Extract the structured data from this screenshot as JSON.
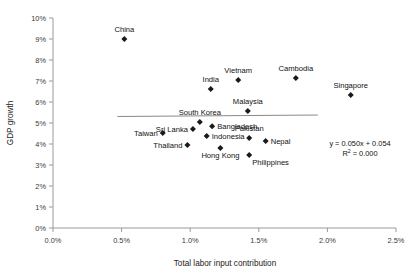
{
  "chart_data": {
    "type": "scatter",
    "title": "",
    "xlabel": "Total labor input contribution",
    "ylabel": "GDP growth",
    "xlim": [
      0.0,
      2.5
    ],
    "ylim": [
      0.0,
      10.0
    ],
    "x_tick_labels": [
      "0.0%",
      "0.5%",
      "1.0%",
      "1.5%",
      "2.0%",
      "2.5%"
    ],
    "x_ticks": [
      0.0,
      0.5,
      1.0,
      1.5,
      2.0,
      2.5
    ],
    "y_tick_labels": [
      "0%",
      "1%",
      "2%",
      "3%",
      "4%",
      "5%",
      "6%",
      "7%",
      "8%",
      "9%",
      "10%"
    ],
    "y_ticks": [
      0,
      1,
      2,
      3,
      4,
      5,
      6,
      7,
      8,
      9,
      10
    ],
    "grid": false,
    "legend": "none",
    "units": "percent",
    "points": [
      {
        "label": "China",
        "x": 0.52,
        "y": 9.0,
        "label_pos": "above"
      },
      {
        "label": "Taiwan",
        "x": 0.8,
        "y": 4.52,
        "label_pos": "left"
      },
      {
        "label": "Thailand",
        "x": 0.98,
        "y": 3.95,
        "label_pos": "left"
      },
      {
        "label": "Sri Lanka",
        "x": 1.02,
        "y": 4.72,
        "label_pos": "left"
      },
      {
        "label": "South Korea",
        "x": 1.07,
        "y": 5.05,
        "label_pos": "above"
      },
      {
        "label": "Indonesia",
        "x": 1.12,
        "y": 4.38,
        "label_pos": "right"
      },
      {
        "label": "Bangladesh",
        "x": 1.16,
        "y": 4.85,
        "label_pos": "right"
      },
      {
        "label": "India",
        "x": 1.15,
        "y": 6.62,
        "label_pos": "above"
      },
      {
        "label": "Hong Kong",
        "x": 1.22,
        "y": 3.81,
        "label_pos": "below"
      },
      {
        "label": "Vietnam",
        "x": 1.35,
        "y": 7.05,
        "label_pos": "above"
      },
      {
        "label": "Malaysia",
        "x": 1.42,
        "y": 5.57,
        "label_pos": "above"
      },
      {
        "label": "Pakistan",
        "x": 1.43,
        "y": 4.29,
        "label_pos": "above"
      },
      {
        "label": "Philippines",
        "x": 1.43,
        "y": 3.48,
        "label_pos": "belowright"
      },
      {
        "label": "Nepal",
        "x": 1.55,
        "y": 4.14,
        "label_pos": "right"
      },
      {
        "label": "Cambodia",
        "x": 1.77,
        "y": 7.14,
        "label_pos": "above"
      },
      {
        "label": "Singapore",
        "x": 2.17,
        "y": 6.33,
        "label_pos": "above"
      }
    ],
    "trendline": {
      "equation": "y = 0.050x + 0.054",
      "r_squared_label": "R",
      "r_squared_sup": "2",
      "r_squared_value": "= 0.000",
      "slope": 0.05,
      "intercept": 0.054,
      "x_start": 0.47,
      "x_end": 1.93,
      "y_start": 5.31,
      "y_end": 5.38
    },
    "colors": {
      "marker": "#1a1a1a",
      "axis": "#9a9a9a",
      "trend": "#8a8a8a",
      "text": "#111111",
      "background": "#ffffff"
    }
  }
}
